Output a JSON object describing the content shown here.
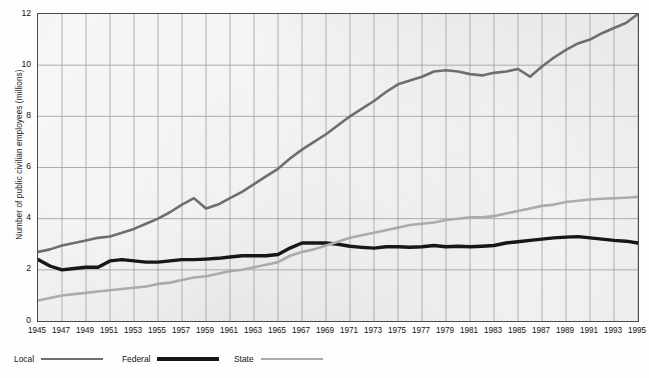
{
  "chart_data": {
    "type": "line",
    "title": "",
    "xlabel": "",
    "ylabel": "Number of public civilian employees (millions)",
    "xlim": [
      1945,
      1995
    ],
    "ylim": [
      0,
      12
    ],
    "yticks": [
      0,
      2,
      4,
      6,
      8,
      10,
      12
    ],
    "grid": true,
    "legend_position": "below-axes-left",
    "x": [
      1945,
      1946,
      1947,
      1948,
      1949,
      1950,
      1951,
      1952,
      1953,
      1954,
      1955,
      1956,
      1957,
      1958,
      1959,
      1960,
      1961,
      1962,
      1963,
      1964,
      1965,
      1966,
      1967,
      1968,
      1969,
      1970,
      1971,
      1972,
      1973,
      1974,
      1975,
      1976,
      1977,
      1978,
      1979,
      1980,
      1981,
      1982,
      1983,
      1984,
      1985,
      1986,
      1987,
      1988,
      1989,
      1990,
      1991,
      1992,
      1993,
      1994,
      1995
    ],
    "xticks": [
      1945,
      1947,
      1949,
      1951,
      1953,
      1955,
      1957,
      1959,
      1961,
      1963,
      1965,
      1967,
      1969,
      1971,
      1973,
      1975,
      1977,
      1979,
      1981,
      1983,
      1985,
      1987,
      1989,
      1991,
      1993,
      1995
    ],
    "series": [
      {
        "name": "Local",
        "color": "#6e6e6e",
        "width": 2.6,
        "values": [
          2.7,
          2.8,
          2.95,
          3.05,
          3.15,
          3.25,
          3.3,
          3.45,
          3.6,
          3.8,
          4.0,
          4.25,
          4.55,
          4.8,
          4.4,
          4.55,
          4.8,
          5.05,
          5.35,
          5.65,
          5.95,
          6.35,
          6.7,
          7.0,
          7.3,
          7.65,
          8.0,
          8.3,
          8.6,
          8.95,
          9.25,
          9.4,
          9.55,
          9.75,
          9.8,
          9.75,
          9.65,
          9.6,
          9.7,
          9.75,
          9.85,
          9.55,
          9.95,
          10.3,
          10.6,
          10.85,
          11.0,
          11.25,
          11.45,
          11.65,
          12.0
        ]
      },
      {
        "name": "Federal",
        "color": "#171717",
        "width": 3.4,
        "values": [
          2.4,
          2.15,
          2.0,
          2.05,
          2.1,
          2.1,
          2.35,
          2.4,
          2.35,
          2.3,
          2.3,
          2.35,
          2.4,
          2.4,
          2.42,
          2.45,
          2.5,
          2.55,
          2.55,
          2.55,
          2.6,
          2.85,
          3.05,
          3.05,
          3.05,
          3.0,
          2.92,
          2.88,
          2.85,
          2.9,
          2.9,
          2.88,
          2.9,
          2.95,
          2.9,
          2.92,
          2.9,
          2.92,
          2.95,
          3.05,
          3.1,
          3.15,
          3.2,
          3.25,
          3.28,
          3.3,
          3.25,
          3.2,
          3.15,
          3.12,
          3.05
        ]
      },
      {
        "name": "State",
        "color": "#ababab",
        "width": 2.6,
        "values": [
          0.8,
          0.9,
          1.0,
          1.05,
          1.1,
          1.15,
          1.2,
          1.25,
          1.3,
          1.35,
          1.45,
          1.5,
          1.6,
          1.7,
          1.75,
          1.85,
          1.95,
          2.0,
          2.1,
          2.2,
          2.3,
          2.55,
          2.7,
          2.8,
          2.95,
          3.1,
          3.25,
          3.35,
          3.45,
          3.55,
          3.65,
          3.75,
          3.8,
          3.85,
          3.95,
          4.0,
          4.05,
          4.05,
          4.1,
          4.2,
          4.3,
          4.4,
          4.5,
          4.55,
          4.65,
          4.7,
          4.75,
          4.78,
          4.8,
          4.82,
          4.85
        ]
      }
    ],
    "legend": [
      {
        "label": "Local",
        "color": "#6e6e6e"
      },
      {
        "label": "Federal",
        "color": "#171717"
      },
      {
        "label": "State",
        "color": "#ababab"
      }
    ]
  }
}
